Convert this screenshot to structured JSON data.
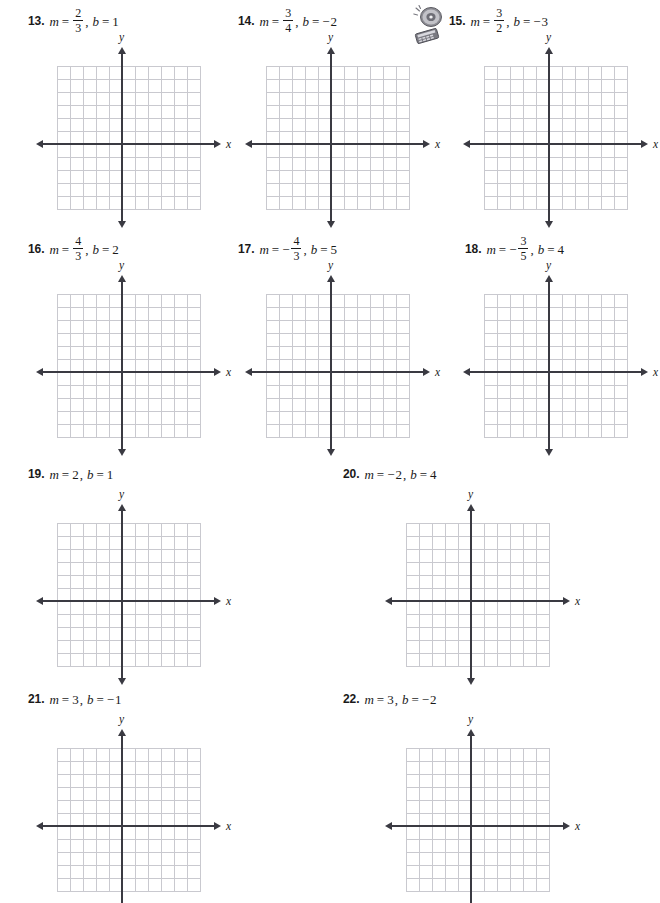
{
  "page": {
    "kind": "math-worksheet",
    "topic": "Graphing lines from slope and y-intercept",
    "axis_label_x": "x",
    "axis_label_y": "y",
    "grid": {
      "cells_x": 11,
      "cells_y": 11,
      "cell_px": 13,
      "line_color": "#c9c9cf",
      "axis_color": "#3a3a42"
    }
  },
  "symbols": {
    "m": "m",
    "b": "b",
    "equals": "=",
    "comma": ",",
    "minus": "−"
  },
  "media_icon": {
    "name": "cd-and-calculator-icon",
    "label": "CD and calculator media icon"
  },
  "problems": [
    {
      "number": "13.",
      "slope": {
        "type": "fraction",
        "sign": "",
        "numerator": "2",
        "denominator": "3",
        "text": "2/3"
      },
      "intercept": {
        "sign": "",
        "value": "1",
        "text": "1"
      },
      "has_media_icon": false,
      "label_x": 28,
      "label_y": 10,
      "grid_x": 57,
      "grid_y": 66,
      "axis_col": 5,
      "axis_row": 6,
      "clipped": false
    },
    {
      "number": "14.",
      "slope": {
        "type": "fraction",
        "sign": "",
        "numerator": "3",
        "denominator": "4",
        "text": "3/4"
      },
      "intercept": {
        "sign": "−",
        "value": "2",
        "text": "−2"
      },
      "has_media_icon": false,
      "label_x": 238,
      "label_y": 10,
      "grid_x": 266,
      "grid_y": 66,
      "axis_col": 5,
      "axis_row": 6,
      "clipped": false
    },
    {
      "number": "15.",
      "slope": {
        "type": "fraction",
        "sign": "",
        "numerator": "3",
        "denominator": "2",
        "text": "3/2"
      },
      "intercept": {
        "sign": "−",
        "value": "3",
        "text": "−3"
      },
      "has_media_icon": true,
      "label_x": 449,
      "label_y": 10,
      "grid_x": 484,
      "grid_y": 66,
      "axis_col": 5,
      "axis_row": 6,
      "clipped": false
    },
    {
      "number": "16.",
      "slope": {
        "type": "fraction",
        "sign": "",
        "numerator": "4",
        "denominator": "3",
        "text": "4/3"
      },
      "intercept": {
        "sign": "",
        "value": "2",
        "text": "2"
      },
      "has_media_icon": false,
      "label_x": 28,
      "label_y": 238,
      "grid_x": 57,
      "grid_y": 294,
      "axis_col": 5,
      "axis_row": 6,
      "clipped": false
    },
    {
      "number": "17.",
      "slope": {
        "type": "fraction",
        "sign": "−",
        "numerator": "4",
        "denominator": "3",
        "text": "−4/3"
      },
      "intercept": {
        "sign": "",
        "value": "5",
        "text": "5"
      },
      "has_media_icon": false,
      "label_x": 238,
      "label_y": 238,
      "grid_x": 266,
      "grid_y": 294,
      "axis_col": 5,
      "axis_row": 6,
      "clipped": false
    },
    {
      "number": "18.",
      "slope": {
        "type": "fraction",
        "sign": "−",
        "numerator": "3",
        "denominator": "5",
        "text": "−3/5"
      },
      "intercept": {
        "sign": "",
        "value": "4",
        "text": "4"
      },
      "has_media_icon": false,
      "label_x": 465,
      "label_y": 238,
      "grid_x": 484,
      "grid_y": 294,
      "axis_col": 5,
      "axis_row": 6,
      "clipped": false
    },
    {
      "number": "19.",
      "slope": {
        "type": "integer",
        "sign": "",
        "value": "2",
        "text": "2"
      },
      "intercept": {
        "sign": "",
        "value": "1",
        "text": "1"
      },
      "has_media_icon": false,
      "label_x": 28,
      "label_y": 463,
      "grid_x": 57,
      "grid_y": 523,
      "axis_col": 5,
      "axis_row": 6,
      "clipped": false
    },
    {
      "number": "20.",
      "slope": {
        "type": "integer",
        "sign": "−",
        "value": "2",
        "text": "−2"
      },
      "intercept": {
        "sign": "",
        "value": "4",
        "text": "4"
      },
      "has_media_icon": false,
      "label_x": 343,
      "label_y": 463,
      "grid_x": 406,
      "grid_y": 523,
      "axis_col": 5,
      "axis_row": 6,
      "clipped": false
    },
    {
      "number": "21.",
      "slope": {
        "type": "integer",
        "sign": "",
        "value": "3",
        "text": "3"
      },
      "intercept": {
        "sign": "−",
        "value": "1",
        "text": "−1"
      },
      "has_media_icon": false,
      "label_x": 28,
      "label_y": 688,
      "grid_x": 57,
      "grid_y": 748,
      "axis_col": 5,
      "axis_row": 6,
      "clipped": true
    },
    {
      "number": "22.",
      "slope": {
        "type": "integer",
        "sign": "",
        "value": "3",
        "text": "3"
      },
      "intercept": {
        "sign": "−",
        "value": "2",
        "text": "−2"
      },
      "has_media_icon": false,
      "label_x": 343,
      "label_y": 688,
      "grid_x": 406,
      "grid_y": 748,
      "axis_col": 5,
      "axis_row": 6,
      "clipped": true
    }
  ]
}
